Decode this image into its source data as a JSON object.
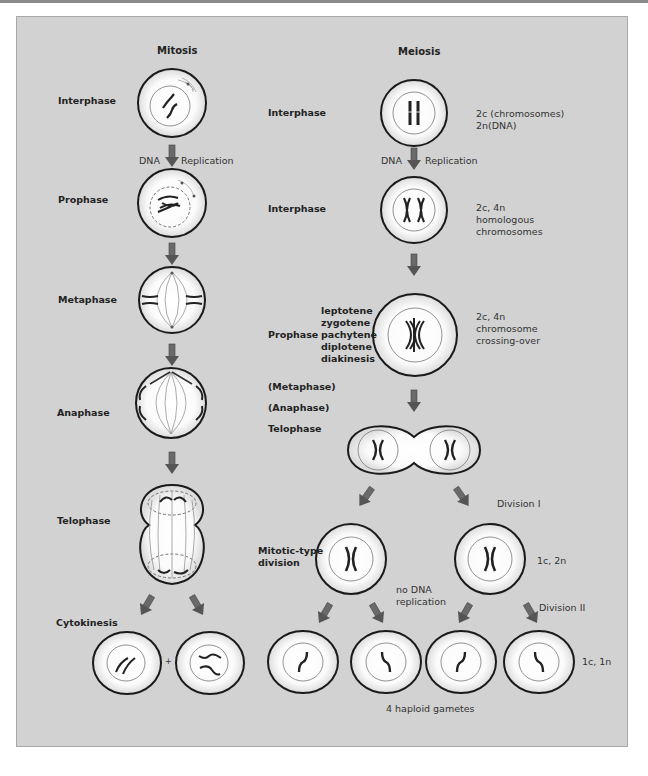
{
  "titles": {
    "mitosis": "Mitosis",
    "meiosis": "Meiosis"
  },
  "mitosis": {
    "stages": [
      "Interphase",
      "Prophase",
      "Metaphase",
      "Anaphase",
      "Telophase",
      "Cytokinesis"
    ],
    "dna_label": "DNA",
    "replication_label": "Replication",
    "plus": "+"
  },
  "meiosis": {
    "stage_interphase_1": "Interphase",
    "stage_interphase_2": "Interphase",
    "dna_label": "DNA",
    "replication_label": "Replication",
    "prophase": "Prophase",
    "prophase_substages": [
      "leptotene",
      "zygotene",
      "pachytene",
      "diplotene",
      "diakinesis"
    ],
    "metaphase": "(Metaphase)",
    "anaphase": "(Anaphase)",
    "telophase": "Telophase",
    "mitotic_type_division": [
      "Mitotic-type",
      "division"
    ],
    "notes": {
      "interphase1": [
        "2c (chromosomes)",
        "2n(DNA)"
      ],
      "interphase2": [
        "2c, 4n",
        "homologous",
        "chromosomes"
      ],
      "prophase": [
        "2c, 4n",
        "chromosome",
        "crossing-over"
      ],
      "division1": "Division I",
      "division1_ploidy": "1c, 2n",
      "no_dna_replication": [
        "no DNA",
        "replication"
      ],
      "division2": "Division II",
      "gametes_ploidy": "1c, 1n",
      "gametes": "4 haploid gametes"
    }
  },
  "colors": {
    "panel_bg": "#d2d2d2",
    "cell_fill": "#ffffff",
    "arrow": "#5a5a5a",
    "outline": "#1a1a1a"
  }
}
